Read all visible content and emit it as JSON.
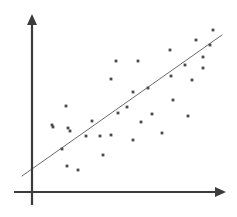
{
  "figure": {
    "width": 237,
    "height": 217,
    "background_color": "#ffffff"
  },
  "colors": {
    "axis": "#3b3b3b",
    "point": "#4a4a4a",
    "fit_line": "#6b6b6b",
    "background": "#ffffff"
  },
  "axes": {
    "y_axis": {
      "label": "",
      "x": 32,
      "y_top": 14,
      "y_bottom": 205,
      "stroke_width": 2.2,
      "arrow_head": "up-arrow-icon"
    },
    "x_axis": {
      "label": "",
      "y": 192,
      "x_left": 14,
      "x_right": 226,
      "stroke_width": 2.2,
      "arrow_head": "right-arrow-icon"
    }
  },
  "chart_data": {
    "type": "scatter",
    "title": "",
    "xlabel": "",
    "ylabel": "",
    "grid": false,
    "legend": "none",
    "xlim": [
      32,
      226
    ],
    "ylim": [
      192,
      14
    ],
    "points": [
      [
        66,
        106
      ],
      [
        53,
        127
      ],
      [
        68,
        128
      ],
      [
        52,
        125
      ],
      [
        70,
        131
      ],
      [
        62,
        149
      ],
      [
        67,
        166
      ],
      [
        78,
        170
      ],
      [
        86,
        136
      ],
      [
        92,
        121
      ],
      [
        100,
        136
      ],
      [
        111,
        135
      ],
      [
        103,
        155
      ],
      [
        111,
        79
      ],
      [
        116,
        61
      ],
      [
        118,
        113
      ],
      [
        127,
        107
      ],
      [
        133,
        92
      ],
      [
        138,
        61
      ],
      [
        133,
        140
      ],
      [
        141,
        122
      ],
      [
        148,
        88
      ],
      [
        152,
        114
      ],
      [
        162,
        133
      ],
      [
        170,
        50
      ],
      [
        171,
        76
      ],
      [
        173,
        100
      ],
      [
        185,
        65
      ],
      [
        188,
        116
      ],
      [
        192,
        80
      ],
      [
        196,
        40
      ],
      [
        203,
        68
      ],
      [
        203,
        57
      ],
      [
        210,
        45
      ],
      [
        213,
        30
      ]
    ],
    "fit_line": {
      "name": "line of best fit",
      "x1": 22,
      "y1": 176,
      "x2": 222,
      "y2": 35,
      "stroke_width": 1.0
    }
  }
}
